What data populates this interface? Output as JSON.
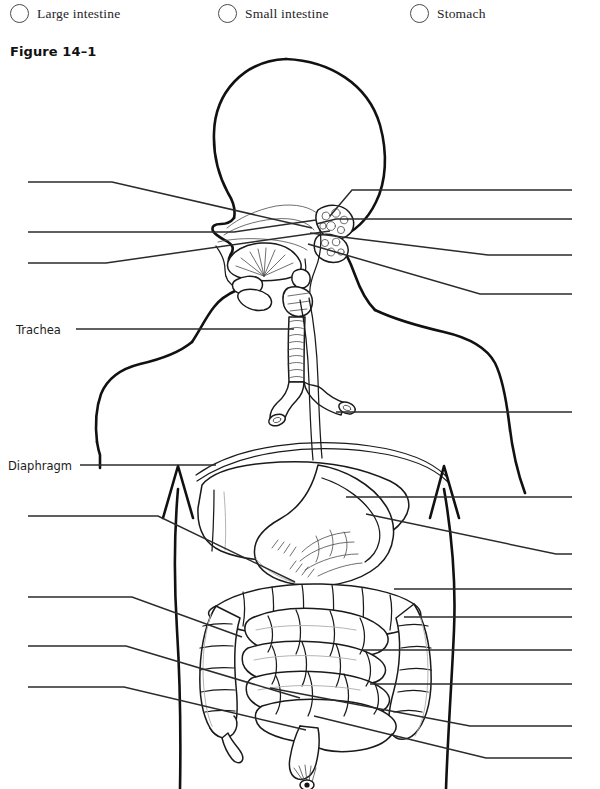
{
  "worksheet": {
    "figure_caption": "Figure 14–1",
    "options": [
      {
        "label": "Large intestine",
        "x": 10,
        "icon": "answer-bubble"
      },
      {
        "label": "Small intestine",
        "x": 218,
        "icon": "answer-bubble"
      },
      {
        "label": "Stomach",
        "x": 410,
        "icon": "answer-bubble"
      }
    ],
    "filled_answers": [
      {
        "label": "Trachea",
        "x": 16,
        "y": 323
      },
      {
        "label": "Diaphragm",
        "x": 8,
        "y": 459
      }
    ],
    "blank_leader_lines": [
      {
        "id": "blank-left-1",
        "side": "left",
        "y": 182
      },
      {
        "id": "blank-left-2",
        "side": "left",
        "y": 232
      },
      {
        "id": "blank-left-3",
        "side": "left",
        "y": 263
      },
      {
        "id": "blank-left-4",
        "side": "left",
        "y": 516
      },
      {
        "id": "blank-left-5",
        "side": "left",
        "y": 597
      },
      {
        "id": "blank-left-6",
        "side": "left",
        "y": 646
      },
      {
        "id": "blank-left-7",
        "side": "left",
        "y": 687
      },
      {
        "id": "blank-right-1",
        "side": "right",
        "y": 190
      },
      {
        "id": "blank-right-2",
        "side": "right",
        "y": 219
      },
      {
        "id": "blank-right-3",
        "side": "right",
        "y": 255
      },
      {
        "id": "blank-right-4",
        "side": "right",
        "y": 294
      },
      {
        "id": "blank-right-5",
        "side": "right",
        "y": 412
      },
      {
        "id": "blank-right-6",
        "side": "right",
        "y": 497
      },
      {
        "id": "blank-right-7",
        "side": "right",
        "y": 554
      },
      {
        "id": "blank-right-8",
        "side": "right",
        "y": 589
      },
      {
        "id": "blank-right-9",
        "side": "right",
        "y": 617
      },
      {
        "id": "blank-right-10",
        "side": "right",
        "y": 650
      },
      {
        "id": "blank-right-11",
        "side": "right",
        "y": 684
      },
      {
        "id": "blank-right-12",
        "side": "right",
        "y": 726
      },
      {
        "id": "blank-right-13",
        "side": "right",
        "y": 758
      }
    ],
    "illustration": {
      "name": "human-digestive-system-diagram",
      "organs": [
        "head-profile",
        "oral-cavity",
        "tongue",
        "pharynx",
        "epiglottis",
        "larynx",
        "trachea",
        "bronchi",
        "esophagus",
        "diaphragm",
        "liver",
        "stomach",
        "gallbladder",
        "transverse-colon",
        "ascending-colon",
        "descending-colon",
        "small-intestine",
        "cecum",
        "appendix",
        "sigmoid-colon",
        "rectum",
        "anus"
      ]
    }
  },
  "colors": {
    "ink": "#1a1a1a",
    "leader": "#2b2b2b",
    "faint": "#9a9a9a",
    "paper": "#ffffff"
  }
}
